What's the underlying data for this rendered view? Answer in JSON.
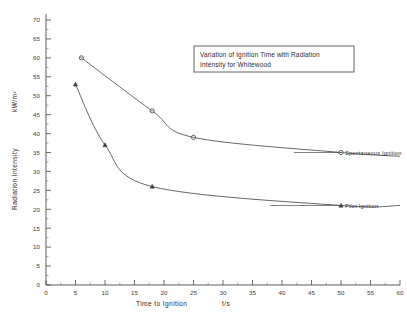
{
  "chart_data": {
    "type": "line",
    "title": "Variation of Ignition Time with Radiation Intensity for Whitewood",
    "title_line1": "Variation of Ignition Time with Radiation",
    "title_line2": "Intensity for Whitewood",
    "xlabel": "Time to Ignition",
    "xunit": "t/s",
    "ylabel": "Radiation Intensity",
    "yunit": "kW/m²",
    "xlim": [
      0,
      60
    ],
    "ylim": [
      0,
      70
    ],
    "xticks": [
      0,
      5,
      10,
      15,
      20,
      25,
      30,
      35,
      40,
      45,
      50,
      55,
      60
    ],
    "yticks": [
      0,
      5,
      10,
      15,
      20,
      25,
      30,
      35,
      40,
      45,
      50,
      55,
      60,
      65,
      70
    ],
    "grid": false,
    "legend_position": "inline-right-annotations",
    "series": [
      {
        "name": "Spontaneous Ignition",
        "marker": "open-circle",
        "x": [
          6,
          18,
          25,
          50
        ],
        "y": [
          60,
          46,
          39,
          35
        ],
        "asymptote": 34
      },
      {
        "name": "Pilot Ignition",
        "marker": "filled-triangle",
        "x": [
          5,
          10,
          18,
          50
        ],
        "y": [
          53,
          37,
          26,
          21
        ],
        "asymptote": 21
      }
    ],
    "annotations": [
      {
        "name": "spontaneous-ignition-label",
        "text": "Spontaneous Ignition"
      },
      {
        "name": "pilot-ignition-label",
        "text": "Pilot Ignition"
      }
    ]
  },
  "axes": {
    "x": {
      "title": "Time to Ignition",
      "unit": "t/s",
      "labels": [
        "0",
        "5",
        "10",
        "15",
        "20",
        "25",
        "30",
        "35",
        "40",
        "45",
        "50",
        "55",
        "60"
      ]
    },
    "y": {
      "title": "Radiation Intensity",
      "unit": "kW/m²",
      "labels": [
        "0",
        "5",
        "10",
        "15",
        "20",
        "25",
        "30",
        "35",
        "40",
        "45",
        "50",
        "55",
        "60",
        "65",
        "70"
      ]
    }
  },
  "colors": {
    "ink": "#4a4a4a",
    "text": "#2b2b2b",
    "background": "#ffffff"
  }
}
